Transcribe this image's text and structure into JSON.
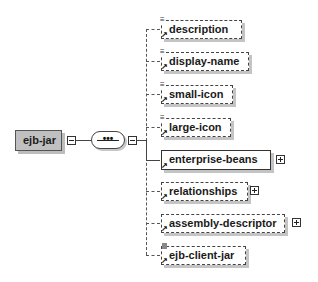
{
  "diagram": {
    "root": {
      "label": "ejb-jar",
      "collapsed": false
    },
    "compositor": {
      "type": "sequence",
      "symbol": "•••"
    },
    "children": [
      {
        "label": "description",
        "occurrence": "optional",
        "has_children": false,
        "doc_icon": "≡"
      },
      {
        "label": "display-name",
        "occurrence": "optional",
        "has_children": false,
        "doc_icon": "≡"
      },
      {
        "label": "small-icon",
        "occurrence": "optional",
        "has_children": false,
        "doc_icon": "≡"
      },
      {
        "label": "large-icon",
        "occurrence": "optional",
        "has_children": false,
        "doc_icon": "≡"
      },
      {
        "label": "enterprise-beans",
        "occurrence": "required",
        "has_children": true,
        "doc_icon": ""
      },
      {
        "label": "relationships",
        "occurrence": "optional",
        "has_children": true,
        "doc_icon": ""
      },
      {
        "label": "assembly-descriptor",
        "occurrence": "optional",
        "has_children": true,
        "doc_icon": ""
      },
      {
        "label": "ejb-client-jar",
        "occurrence": "optional",
        "has_children": false,
        "doc_icon": "▪"
      }
    ],
    "ref_arrow": "↗"
  }
}
